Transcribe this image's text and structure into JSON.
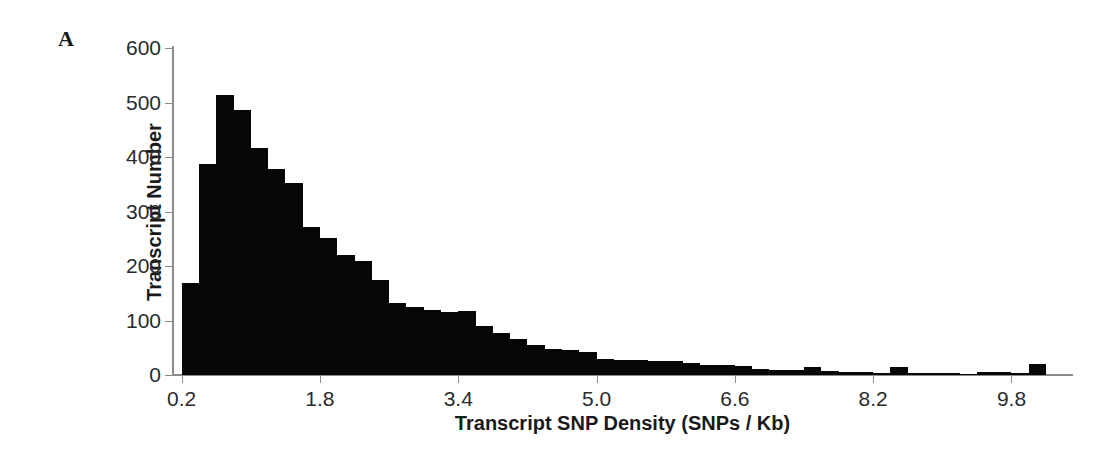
{
  "figure": {
    "panel_label": "A",
    "background_color": "#ffffff",
    "bar_color": "#060606",
    "axis_color": "#8c8c8c"
  },
  "chart_data": {
    "type": "bar",
    "title": "",
    "subtitle": "",
    "xlabel": "Transcript SNP Density (SNPs / Kb)",
    "ylabel": "Transcript Number",
    "xlim": [
      0.1,
      10.5
    ],
    "ylim": [
      0,
      600
    ],
    "grid": false,
    "legend": null,
    "bin_width": 0.2,
    "x_tick_labels": [
      "0.2",
      "1.8",
      "3.4",
      "5.0",
      "6.6",
      "8.2",
      "9.8"
    ],
    "x_tick_values": [
      0.2,
      1.8,
      3.4,
      5.0,
      6.6,
      8.2,
      9.8
    ],
    "y_tick_labels": [
      "0",
      "100",
      "200",
      "300",
      "400",
      "500",
      "600"
    ],
    "y_tick_values": [
      0,
      100,
      200,
      300,
      400,
      500,
      600
    ],
    "x": [
      0.3,
      0.5,
      0.7,
      0.9,
      1.1,
      1.3,
      1.5,
      1.7,
      1.9,
      2.1,
      2.3,
      2.5,
      2.7,
      2.9,
      3.1,
      3.3,
      3.5,
      3.7,
      3.9,
      4.1,
      4.3,
      4.5,
      4.7,
      4.9,
      5.1,
      5.3,
      5.5,
      5.7,
      5.9,
      6.1,
      6.3,
      6.5,
      6.7,
      6.9,
      7.1,
      7.3,
      7.5,
      7.7,
      7.9,
      8.1,
      8.3,
      8.5,
      8.7,
      8.9,
      9.1,
      9.3,
      9.5,
      9.7,
      9.9,
      10.1
    ],
    "values": [
      168,
      388,
      514,
      487,
      417,
      378,
      352,
      271,
      252,
      220,
      209,
      175,
      132,
      125,
      120,
      116,
      117,
      90,
      78,
      66,
      55,
      48,
      45,
      42,
      30,
      28,
      27,
      26,
      25,
      22,
      19,
      18,
      17,
      11,
      10,
      9,
      14,
      8,
      6,
      5,
      4,
      14,
      4,
      3,
      3,
      2,
      6,
      5,
      4,
      20
    ],
    "series": [
      {
        "name": "Transcript Number",
        "values": [
          168,
          388,
          514,
          487,
          417,
          378,
          352,
          271,
          252,
          220,
          209,
          175,
          132,
          125,
          120,
          116,
          117,
          90,
          78,
          66,
          55,
          48,
          45,
          42,
          30,
          28,
          27,
          26,
          25,
          22,
          19,
          18,
          17,
          11,
          10,
          9,
          14,
          8,
          6,
          5,
          4,
          14,
          4,
          3,
          3,
          2,
          6,
          5,
          4,
          20
        ]
      }
    ]
  }
}
